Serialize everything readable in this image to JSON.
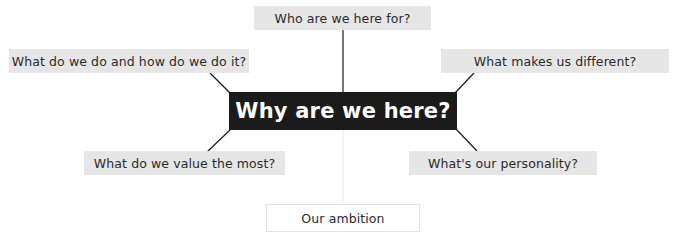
{
  "diagram": {
    "center": {
      "label": "Why are we here?"
    },
    "nodes": [
      {
        "id": "top",
        "label": "Who are we here for?"
      },
      {
        "id": "upper-left",
        "label": "What do we do and how do we do it?"
      },
      {
        "id": "upper-right",
        "label": "What makes us different?"
      },
      {
        "id": "lower-left",
        "label": "What do we value the most?"
      },
      {
        "id": "lower-right",
        "label": "What's our personality?"
      }
    ],
    "footer": {
      "label": "Our ambition"
    },
    "side_caption": "The Brand G..."
  },
  "colors": {
    "center_bg": "#1b1b1b",
    "center_text": "#ffffff",
    "node_bg": "#e6e6e6",
    "node_text": "#2b2b2b",
    "connector": "#1b1b1b",
    "footer_border": "#e3e3e3"
  }
}
